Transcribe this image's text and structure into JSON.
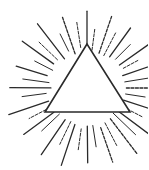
{
  "illustration": {
    "subject": "triangle with radiating rays",
    "background": "#ffffff",
    "stroke": "#2a2a2a",
    "center": [
      87,
      88
    ],
    "triangle": {
      "apex": [
        87,
        44
      ],
      "bottom_left": [
        45,
        112
      ],
      "bottom_right": [
        130,
        112
      ]
    },
    "ray_count": 40
  }
}
